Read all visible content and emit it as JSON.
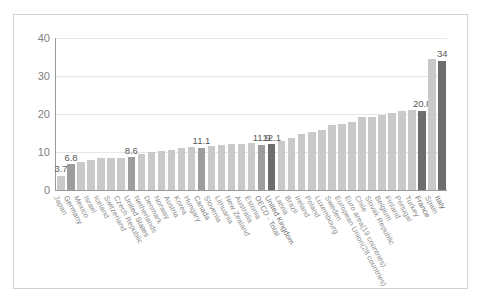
{
  "chart_data": {
    "type": "bar",
    "title": "",
    "subtitle": "",
    "xlabel": "",
    "ylabel": "",
    "ylim": [
      0,
      40
    ],
    "yticks": [
      "0",
      "10",
      "20",
      "30",
      "40"
    ],
    "grid": true,
    "legend": "none",
    "colors": {
      "light": "#c9c9c9",
      "mid": "#9d9d9d",
      "dark": "#6d6d6d"
    },
    "categories": [
      "Japan",
      "Germany",
      "Mexico",
      "Israel",
      "Iceland",
      "Switzerland",
      "Czech Republic",
      "United States",
      "Netherlands",
      "Denmark",
      "Norway",
      "Austria",
      "Korea",
      "Hungary",
      "Canada",
      "Slovenia",
      "Lithuania",
      "New Zealand",
      "Australia",
      "Estonia",
      "OECD - Total",
      "United Kingdom",
      "Latvia",
      "Brazil",
      "Ireland",
      "Poland",
      "Luxembourg",
      "Sweden",
      "European Union(28 countries)",
      "Euro area(19 countries)",
      "Chile",
      "Slovak Republic",
      "Belgium",
      "Finland",
      "Portugal",
      "Turkey",
      "France",
      "Spain",
      "Italy"
    ],
    "values": [
      3.7,
      6.8,
      7.5,
      7.8,
      8.3,
      8.4,
      8.4,
      8.6,
      9.5,
      10.0,
      10.2,
      10.6,
      11.0,
      11.3,
      11.1,
      11.5,
      11.9,
      12.0,
      12.2,
      12.5,
      11.9,
      12.1,
      12.8,
      13.7,
      14.8,
      15.2,
      15.8,
      17.2,
      17.4,
      18.0,
      19.1,
      19.3,
      19.8,
      20.2,
      20.7,
      21.0,
      20.8,
      34.5,
      34
    ],
    "shades": [
      "light",
      "mid",
      "light",
      "light",
      "light",
      "light",
      "light",
      "mid",
      "light",
      "light",
      "light",
      "light",
      "light",
      "light",
      "mid",
      "light",
      "light",
      "light",
      "light",
      "light",
      "mid",
      "dark",
      "light",
      "light",
      "light",
      "light",
      "light",
      "light",
      "light",
      "light",
      "light",
      "light",
      "light",
      "light",
      "light",
      "light",
      "dark",
      "light",
      "dark"
    ],
    "data_labels": {
      "0": "3.7",
      "1": "6.8",
      "7": "8.6",
      "14": "11.1",
      "20": "11.9",
      "21": "12.1",
      "36": "20.8",
      "38": "34"
    }
  }
}
